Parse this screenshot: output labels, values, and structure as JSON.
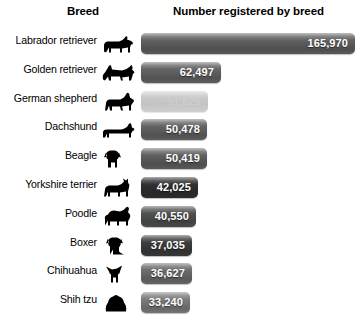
{
  "header": {
    "breed_label": "Breed",
    "number_label": "Number registered by breed"
  },
  "chart_data": {
    "type": "bar",
    "title": "Number registered by breed",
    "xlabel": "Number registered by breed",
    "ylabel": "Breed",
    "orientation": "horizontal",
    "grid": false,
    "legend": false,
    "xlim": [
      0,
      165970
    ],
    "categories": [
      "Labrador retriever",
      "Golden retriever",
      "German shepherd",
      "Dachshund",
      "Beagle",
      "Yorkshire terrier",
      "Poodle",
      "Boxer",
      "Chihuahua",
      "Shih tzu"
    ],
    "values": [
      165970,
      62497,
      51625,
      50478,
      50419,
      42025,
      40550,
      37035,
      36627,
      33240
    ],
    "value_labels": [
      "165,970",
      "62,497",
      "51,625",
      "50,478",
      "50,419",
      "42,025",
      "40,550",
      "37,035",
      "36,627",
      "33,240"
    ],
    "bar_colors": [
      "#5e5e5e",
      "#626262",
      "#b5b5b5",
      "#616161",
      "#5d5d5d",
      "#2f2f2f",
      "#4e4e4e",
      "#3b3b3b",
      "#6a6a6a",
      "#7a7a7a"
    ],
    "bar_pixel_widths": [
      214,
      80,
      67,
      66,
      66,
      57,
      55,
      51,
      51,
      49
    ],
    "icons": [
      "dog-labrador-icon",
      "dog-golden-retriever-icon",
      "dog-german-shepherd-icon",
      "dog-dachshund-icon",
      "dog-beagle-icon",
      "dog-yorkshire-terrier-icon",
      "dog-poodle-icon",
      "dog-boxer-icon",
      "dog-chihuahua-icon",
      "dog-shih-tzu-icon"
    ]
  }
}
